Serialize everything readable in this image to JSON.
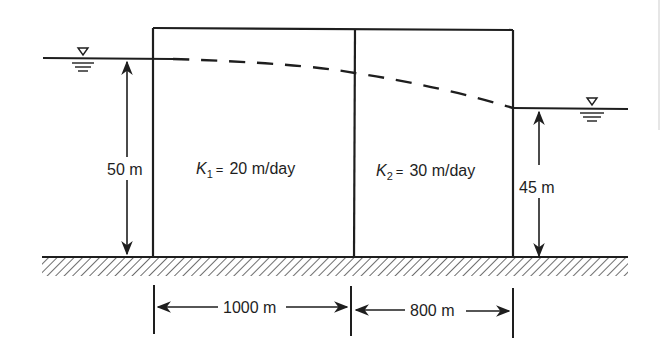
{
  "figure": {
    "type": "two-layer aquifer cross-section (confined flow in series)",
    "colors": {
      "ink": "#1e1e1e",
      "background": "#ffffff",
      "edge_line": "#e6e6e6"
    }
  },
  "left_reservoir": {
    "water_level_symbol": "water-table-triangle",
    "head_label": "50 m",
    "head_value_m": 50
  },
  "right_reservoir": {
    "water_level_symbol": "water-table-triangle",
    "head_label": "45 m",
    "head_value_m": 45
  },
  "zones": [
    {
      "symbol": "K",
      "subscript": "1",
      "equals": "=",
      "value_text": "20 m/day",
      "k_m_per_day": 20,
      "length_label": "1000 m",
      "length_m": 1000
    },
    {
      "symbol": "K",
      "subscript": "2",
      "equals": "=",
      "value_text": "30 m/day",
      "k_m_per_day": 30,
      "length_label": "800 m",
      "length_m": 800
    }
  ],
  "phreatic_line": {
    "style": "dashed",
    "from_head_m": 50,
    "to_head_m": 45
  },
  "base": {
    "style": "hatched impermeable ground"
  }
}
